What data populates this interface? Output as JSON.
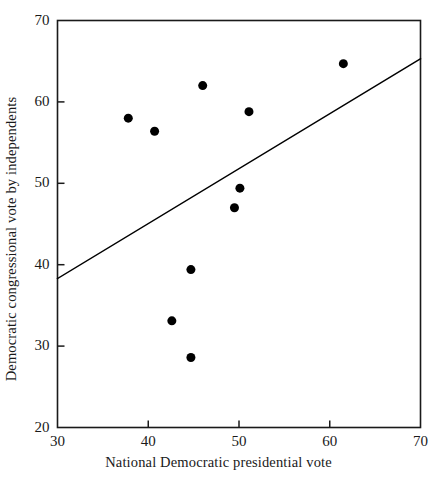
{
  "chart_data": {
    "type": "scatter",
    "title": "",
    "xlabel": "National Democratic presidential vote",
    "ylabel": "Democratic congressional vote by independents",
    "xlim": [
      30,
      70
    ],
    "ylim": [
      20,
      70
    ],
    "xticks": [
      30,
      40,
      50,
      60,
      70
    ],
    "yticks": [
      20,
      30,
      40,
      50,
      60,
      70
    ],
    "xtick_labels": [
      "30",
      "40",
      "50",
      "60",
      "70"
    ],
    "ytick_labels": [
      "20",
      "30",
      "40",
      "50",
      "60",
      "70"
    ],
    "grid": false,
    "legend": false,
    "marker": "filled-circle",
    "marker_color": "#000000",
    "marker_size_px": 9,
    "points": [
      {
        "x": 37.8,
        "y": 58.0
      },
      {
        "x": 40.7,
        "y": 56.4
      },
      {
        "x": 46.0,
        "y": 62.0
      },
      {
        "x": 51.1,
        "y": 58.8
      },
      {
        "x": 50.1,
        "y": 49.4
      },
      {
        "x": 49.5,
        "y": 47.0
      },
      {
        "x": 44.7,
        "y": 39.4
      },
      {
        "x": 42.6,
        "y": 33.1
      },
      {
        "x": 44.7,
        "y": 28.6
      },
      {
        "x": 61.5,
        "y": 64.7
      }
    ],
    "fit_line": {
      "type": "line",
      "color": "#000000",
      "x0": 30,
      "y0": 38.3,
      "x1": 70,
      "y1": 65.3
    },
    "axis_color": "#1a1a1a",
    "background": "#ffffff"
  }
}
